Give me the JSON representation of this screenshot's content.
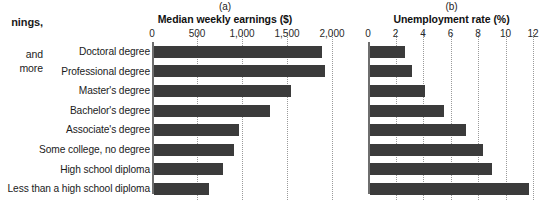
{
  "side_text": {
    "line1": "nings,",
    "line2": "and",
    "line3": "more"
  },
  "categories": [
    "Doctoral degree",
    "Professional degree",
    "Master's degree",
    "Bachelor's degree",
    "Associate's degree",
    "Some college, no degree",
    "High school diploma",
    "Less than a high school diploma"
  ],
  "panel_a": {
    "letter": "(a)",
    "title": "Median weekly earnings ($)",
    "ticks": [
      "0",
      "500",
      "1,000",
      "1,500",
      "2,000"
    ]
  },
  "panel_b": {
    "letter": "(b)",
    "title": "Unemployment rate (%)",
    "ticks": [
      "0",
      "2",
      "4",
      "6",
      "8",
      "10",
      "12"
    ]
  },
  "colors": {
    "bar": "#3b3b3b",
    "axis": "#6e6e6e",
    "grid": "#9a9a9a",
    "text": "#1b1b1b",
    "background": "#ffffff"
  },
  "chart_data": [
    {
      "type": "bar",
      "orientation": "horizontal",
      "title": "Median weekly earnings ($)",
      "panel": "(a)",
      "xlabel": "Median weekly earnings ($)",
      "ylabel": "",
      "categories": [
        "Doctoral degree",
        "Professional degree",
        "Master's degree",
        "Bachelor's degree",
        "Associate's degree",
        "Some college, no degree",
        "High school diploma",
        "Less than a high school diploma"
      ],
      "values": [
        1885,
        1924,
        1545,
        1305,
        963,
        899,
        781,
        626
      ],
      "xlim": [
        0,
        2000
      ],
      "xticks": [
        0,
        500,
        1000,
        1500,
        2000
      ],
      "xticklabels": [
        "0",
        "500",
        "1,000",
        "1,500",
        "2,000"
      ],
      "grid": "vertical-dotted",
      "legend": "none"
    },
    {
      "type": "bar",
      "orientation": "horizontal",
      "title": "Unemployment rate (%)",
      "panel": "(b)",
      "xlabel": "Unemployment rate (%)",
      "ylabel": "",
      "categories": [
        "Doctoral degree",
        "Professional degree",
        "Master's degree",
        "Bachelor's degree",
        "Associate's degree",
        "Some college, no degree",
        "High school diploma",
        "Less than a high school diploma"
      ],
      "values": [
        2.6,
        3.1,
        4.1,
        5.5,
        7.1,
        8.3,
        9.0,
        11.7
      ],
      "xlim": [
        0,
        12
      ],
      "xticks": [
        0,
        2,
        4,
        6,
        8,
        10,
        12
      ],
      "xticklabels": [
        "0",
        "2",
        "4",
        "6",
        "8",
        "10",
        "12"
      ],
      "grid": "vertical-dotted",
      "legend": "none"
    }
  ]
}
